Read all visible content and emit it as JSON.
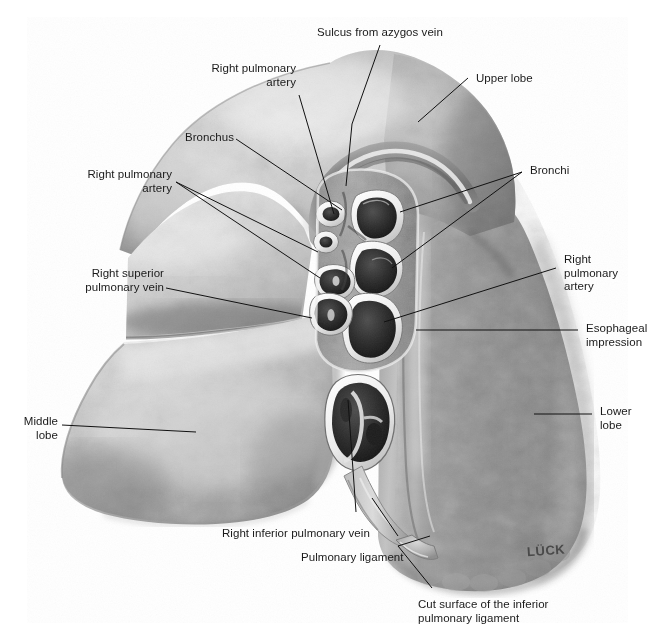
{
  "figure": {
    "kind": "anatomical-illustration",
    "rendering": "grayscale airbrush / pencil medical illustration",
    "background_color": "#ffffff",
    "ink_color": "#1a1a1a",
    "signature": "LÜCK"
  },
  "labels": {
    "sulcus_azygos": "Sulcus from azygos vein",
    "upper_lobe": "Upper lobe",
    "right_pulmonary_artery_top": "Right pulmonary\nartery",
    "bronchus": "Bronchus",
    "right_pulmonary_artery_left": "Right pulmonary\nartery",
    "right_superior_pulmonary_vein": "Right superior\npulmonary vein",
    "bronchi": "Bronchi",
    "right_pulmonary_artery_right": "Right\npulmonary\nartery",
    "esophageal_impression": "Esophageal\nimpression",
    "lower_lobe": "Lower\nlobe",
    "middle_lobe": "Middle\nlobe",
    "right_inferior_pulmonary_vein": "Right inferior pulmonary vein",
    "pulmonary_ligament": "Pulmonary ligament",
    "cut_surface": "Cut surface of the inferior\npulmonary ligament"
  },
  "structures": [
    {
      "name": "upper-lobe",
      "note": "large superior lobe, lighter mottled parenchyma"
    },
    {
      "name": "middle-lobe",
      "note": "anterior wedge, left of image, pale lobular texture"
    },
    {
      "name": "lower-lobe",
      "note": "large inferior/posterior lobe, darker gray mottling"
    },
    {
      "name": "horizontal-fissure",
      "note": "separates upper and middle lobe"
    },
    {
      "name": "oblique-fissure",
      "note": "separates middle/upper from lower lobe"
    },
    {
      "name": "hilum",
      "note": "central cut root with bronchi, arteries and veins in cross-section"
    },
    {
      "name": "azygos-sulcus",
      "note": "curved groove arching over the hilum at apex"
    },
    {
      "name": "esophageal-impression",
      "note": "vertical shallow groove posterior to hilum"
    },
    {
      "name": "pulmonary-ligament",
      "note": "fold descending from inferior hilum"
    }
  ]
}
